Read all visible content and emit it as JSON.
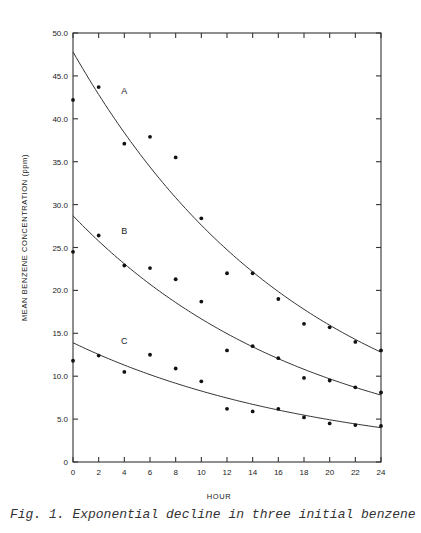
{
  "chart_data": {
    "type": "scatter",
    "title": "",
    "xlabel": "HOUR",
    "ylabel": "MEAN BENZENE CONCENTRATION (ppm)",
    "xlim": [
      0,
      24
    ],
    "ylim": [
      0,
      50
    ],
    "x_ticks": [
      "0",
      "2",
      "4",
      "6",
      "8",
      "10",
      "12",
      "14",
      "16",
      "18",
      "20",
      "22",
      "24"
    ],
    "y_ticks": [
      "0",
      "5.0",
      "10.0",
      "15.0",
      "20.0",
      "25.0",
      "30.0",
      "35.0",
      "40.0",
      "45.0",
      "50.0"
    ],
    "grid": false,
    "x": [
      0,
      2,
      4,
      6,
      8,
      10,
      12,
      14,
      16,
      18,
      20,
      22,
      24
    ],
    "series": [
      {
        "name": "A",
        "points": [
          42.2,
          43.7,
          37.1,
          37.9,
          35.5,
          28.4,
          22.0,
          22.0,
          19.0,
          16.1,
          15.7,
          14.0,
          13.0
        ],
        "fit": {
          "type": "exponential",
          "initial": 47.8,
          "final_at_24": 12.8
        }
      },
      {
        "name": "B",
        "points": [
          24.5,
          26.4,
          22.9,
          22.6,
          21.3,
          18.7,
          13.0,
          13.5,
          12.1,
          9.8,
          9.5,
          8.7,
          8.1
        ],
        "fit": {
          "type": "exponential",
          "initial": 28.7,
          "final_at_24": 7.8
        }
      },
      {
        "name": "C",
        "points": [
          11.8,
          12.4,
          10.5,
          12.5,
          10.9,
          9.4,
          6.2,
          5.9,
          6.2,
          5.2,
          4.5,
          4.3,
          4.2
        ],
        "fit": {
          "type": "exponential",
          "initial": 13.9,
          "final_at_24": 4.0
        }
      }
    ],
    "caption": "Fig. 1.  Exponential decline in three initial benzene"
  }
}
